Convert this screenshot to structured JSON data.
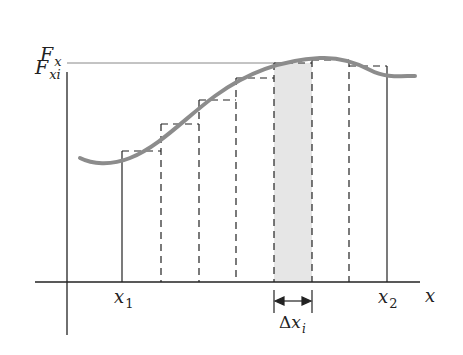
{
  "diagram": {
    "labels": {
      "y_axis": {
        "main": "F",
        "sub": "x"
      },
      "f_xi": {
        "main": "F",
        "sub": "xi"
      },
      "x_axis": "x",
      "x1": {
        "main": "x",
        "sub": "1"
      },
      "x2": {
        "main": "x",
        "sub": "2"
      },
      "delta": {
        "prefix": "Δ",
        "main": "x",
        "sub": "i"
      }
    },
    "colors": {
      "curve": "#8c8c8c",
      "shaded_strip": "#e6e6e6",
      "axes": "#222222",
      "dashed": "#222222"
    },
    "rectangles": [
      {
        "x_left": 122,
        "x_right": 161,
        "top": 151,
        "shaded": false
      },
      {
        "x_left": 161,
        "x_right": 199,
        "top": 124,
        "shaded": false
      },
      {
        "x_left": 199,
        "x_right": 236,
        "top": 100,
        "shaded": false
      },
      {
        "x_left": 236,
        "x_right": 274,
        "top": 78,
        "shaded": false
      },
      {
        "x_left": 274,
        "x_right": 312,
        "top": 63,
        "shaded": true
      },
      {
        "x_left": 312,
        "x_right": 349,
        "top": 60,
        "shaded": false
      },
      {
        "x_left": 349,
        "x_right": 387,
        "top": 66,
        "shaded": false
      }
    ]
  }
}
